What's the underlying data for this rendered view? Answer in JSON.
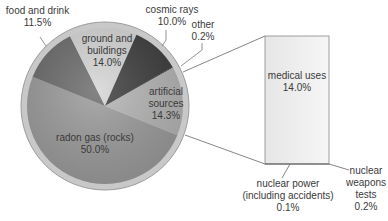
{
  "chart_data": {
    "type": "pie",
    "title": "",
    "slices": [
      {
        "label": "radon gas (rocks)",
        "value": 50.0,
        "display": "50.0%",
        "color": "#9a9a9a"
      },
      {
        "label": "food and drink",
        "value": 11.5,
        "display": "11.5%",
        "color": "#6a6a6a"
      },
      {
        "label": "ground and buildings",
        "value": 14.0,
        "display": "14.0%",
        "color": "#d4d4d4"
      },
      {
        "label": "cosmic rays",
        "value": 10.0,
        "display": "10.0%",
        "color": "#3c3c3c"
      },
      {
        "label": "other",
        "value": 0.2,
        "display": "0.2%",
        "color": "#222222"
      },
      {
        "label": "artificial sources",
        "value": 14.3,
        "display": "14.3%",
        "color": "#b4b4b4"
      }
    ],
    "breakdown": {
      "of": "artificial sources",
      "type": "stacked-bar",
      "items": [
        {
          "label": "medical uses",
          "value": 14.0,
          "display": "14.0%"
        },
        {
          "label": "nuclear power (including accidents)",
          "value": 0.1,
          "display": "0.1%"
        },
        {
          "label": "nuclear weapons tests",
          "value": 0.2,
          "display": "0.2%"
        }
      ]
    }
  },
  "labels": {
    "food": {
      "line1": "food and drink",
      "line2": "11.5%"
    },
    "cosmic": {
      "line1": "cosmic rays",
      "line2": "10.0%"
    },
    "other": {
      "line1": "other",
      "line2": "0.2%"
    },
    "ground": {
      "line1": "ground and",
      "line2": "buildings",
      "line3": "14.0%"
    },
    "artificial": {
      "line1": "artificial",
      "line2": "sources",
      "line3": "14.3%"
    },
    "radon": {
      "line1": "radon gas (rocks)",
      "line2": "50.0%"
    },
    "medical": {
      "line1": "medical uses",
      "line2": "14.0%"
    },
    "power": {
      "line1": "nuclear power",
      "line2": "(including accidents)",
      "line3": "0.1%"
    },
    "weapons": {
      "line1": "nuclear",
      "line2": "weapons",
      "line3": "tests",
      "line4": "0.2%"
    }
  }
}
